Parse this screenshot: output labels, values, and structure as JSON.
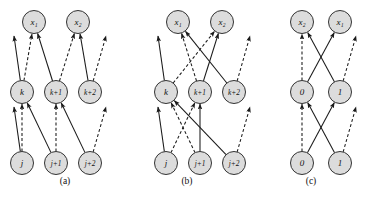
{
  "figure": {
    "type": "diagram",
    "background_color": "#ffffff",
    "node_fill": "#dcdcdc",
    "node_stroke": "#333333",
    "edge_color": "#1a1a1a",
    "label_color": "#111111",
    "node_radius": 11.5
  },
  "panels": [
    {
      "id": "a",
      "caption": "(a)",
      "caption_x": 65,
      "caption_y": 184,
      "rows": [
        {
          "name": "top-row",
          "y": 22,
          "nodes": [
            {
              "id": "a-x1",
              "label": "x₁",
              "x": 34,
              "y": 22
            },
            {
              "id": "a-x2",
              "label": "x₂",
              "x": 78,
              "y": 22
            }
          ]
        },
        {
          "name": "middle-row",
          "y": 92,
          "nodes": [
            {
              "id": "a-k",
              "label": "k",
              "x": 22,
              "y": 92
            },
            {
              "id": "a-k1",
              "label": "k+1",
              "x": 56,
              "y": 92
            },
            {
              "id": "a-k2",
              "label": "k+2",
              "x": 90,
              "y": 92
            }
          ]
        },
        {
          "name": "bottom-row",
          "y": 163,
          "nodes": [
            {
              "id": "a-j",
              "label": "j",
              "x": 22,
              "y": 163
            },
            {
              "id": "a-j1",
              "label": "j+1",
              "x": 56,
              "y": 163
            },
            {
              "id": "a-j2",
              "label": "j+2",
              "x": 90,
              "y": 163
            }
          ]
        }
      ],
      "edges": [
        {
          "from": "a-k",
          "to": [
            14,
            36
          ],
          "style": "solid",
          "dangling": true
        },
        {
          "from": "a-k",
          "to": "a-x1",
          "style": "dashed",
          "dangling": false
        },
        {
          "from": "a-k1",
          "to": "a-x1",
          "style": "solid",
          "dangling": false
        },
        {
          "from": "a-k1",
          "to": "a-x2",
          "style": "dashed",
          "dangling": false
        },
        {
          "from": "a-k2",
          "to": "a-x2",
          "style": "solid",
          "dangling": false
        },
        {
          "from": "a-k2",
          "to": [
            106,
            36
          ],
          "style": "dashed",
          "dangling": true
        },
        {
          "from": "a-j",
          "to": [
            14,
            107
          ],
          "style": "solid",
          "dangling": true
        },
        {
          "from": "a-j",
          "to": "a-k",
          "style": "dashed",
          "dangling": false
        },
        {
          "from": "a-j1",
          "to": "a-k",
          "style": "solid",
          "dangling": false
        },
        {
          "from": "a-j1",
          "to": "a-k1",
          "style": "dashed",
          "dangling": false
        },
        {
          "from": "a-j2",
          "to": "a-k1",
          "style": "solid",
          "dangling": false
        },
        {
          "from": "a-j2",
          "to": [
            106,
            107
          ],
          "style": "dashed",
          "dangling": true
        }
      ]
    },
    {
      "id": "b",
      "caption": "(b)",
      "caption_x": 187,
      "caption_y": 184,
      "rows": [
        {
          "name": "top-row",
          "y": 22,
          "nodes": [
            {
              "id": "b-x1",
              "label": "x₁",
              "x": 178,
              "y": 22
            },
            {
              "id": "b-x2",
              "label": "x₂",
              "x": 222,
              "y": 22
            }
          ]
        },
        {
          "name": "middle-row",
          "y": 92,
          "nodes": [
            {
              "id": "b-k",
              "label": "k",
              "x": 166,
              "y": 92
            },
            {
              "id": "b-k1",
              "label": "k+1",
              "x": 200,
              "y": 92
            },
            {
              "id": "b-k2",
              "label": "k+2",
              "x": 234,
              "y": 92
            }
          ]
        },
        {
          "name": "bottom-row",
          "y": 163,
          "nodes": [
            {
              "id": "b-j",
              "label": "j",
              "x": 166,
              "y": 163
            },
            {
              "id": "b-j1",
              "label": "j+1",
              "x": 200,
              "y": 163
            },
            {
              "id": "b-j2",
              "label": "j+2",
              "x": 234,
              "y": 163
            }
          ]
        }
      ],
      "edges": [
        {
          "from": "b-k",
          "to": [
            158,
            36
          ],
          "style": "solid",
          "dangling": true
        },
        {
          "from": "b-k",
          "to": "b-x2",
          "style": "dashed",
          "dangling": false
        },
        {
          "from": "b-k1",
          "to": "b-x1",
          "style": "dashed",
          "dangling": false
        },
        {
          "from": "b-k1",
          "to": "b-x2",
          "style": "solid",
          "dangling": false
        },
        {
          "from": "b-k2",
          "to": "b-x1",
          "style": "solid",
          "dangling": false
        },
        {
          "from": "b-k2",
          "to": [
            250,
            36
          ],
          "style": "dashed",
          "dangling": true
        },
        {
          "from": "b-j",
          "to": [
            158,
            107
          ],
          "style": "solid",
          "dangling": true
        },
        {
          "from": "b-j",
          "to": "b-k1",
          "style": "dashed",
          "dangling": false
        },
        {
          "from": "b-j1",
          "to": "b-k",
          "style": "dashed",
          "dangling": false
        },
        {
          "from": "b-j1",
          "to": "b-k1",
          "style": "solid",
          "dangling": false
        },
        {
          "from": "b-j2",
          "to": "b-k",
          "style": "solid",
          "dangling": false
        },
        {
          "from": "b-j2",
          "to": [
            250,
            107
          ],
          "style": "dashed",
          "dangling": true
        }
      ]
    },
    {
      "id": "c",
      "caption": "(c)",
      "caption_x": 311,
      "caption_y": 184,
      "rows": [
        {
          "name": "top-row",
          "y": 22,
          "nodes": [
            {
              "id": "c-x2",
              "label": "x₂",
              "x": 302,
              "y": 22
            },
            {
              "id": "c-x1",
              "label": "x₁",
              "x": 340,
              "y": 22
            }
          ]
        },
        {
          "name": "middle-row",
          "y": 92,
          "nodes": [
            {
              "id": "c-m0",
              "label": "0",
              "x": 302,
              "y": 92
            },
            {
              "id": "c-m1",
              "label": "1",
              "x": 340,
              "y": 92
            }
          ]
        },
        {
          "name": "bottom-row",
          "y": 163,
          "nodes": [
            {
              "id": "c-b0",
              "label": "0",
              "x": 302,
              "y": 163
            },
            {
              "id": "c-b1",
              "label": "1",
              "x": 340,
              "y": 163
            }
          ]
        }
      ],
      "edges": [
        {
          "from": "c-m0",
          "to": "c-x2",
          "style": "dashed",
          "dangling": false
        },
        {
          "from": "c-m0",
          "to": "c-x1",
          "style": "solid",
          "dangling": false
        },
        {
          "from": "c-m1",
          "to": "c-x2",
          "style": "solid",
          "dangling": false
        },
        {
          "from": "c-m1",
          "to": [
            356,
            36
          ],
          "style": "dashed",
          "dangling": true
        },
        {
          "from": "c-b0",
          "to": "c-m0",
          "style": "dashed",
          "dangling": false
        },
        {
          "from": "c-b0",
          "to": "c-m1",
          "style": "solid",
          "dangling": false
        },
        {
          "from": "c-b1",
          "to": "c-m0",
          "style": "solid",
          "dangling": false
        },
        {
          "from": "c-b1",
          "to": [
            356,
            107
          ],
          "style": "dashed",
          "dangling": true
        }
      ]
    }
  ]
}
